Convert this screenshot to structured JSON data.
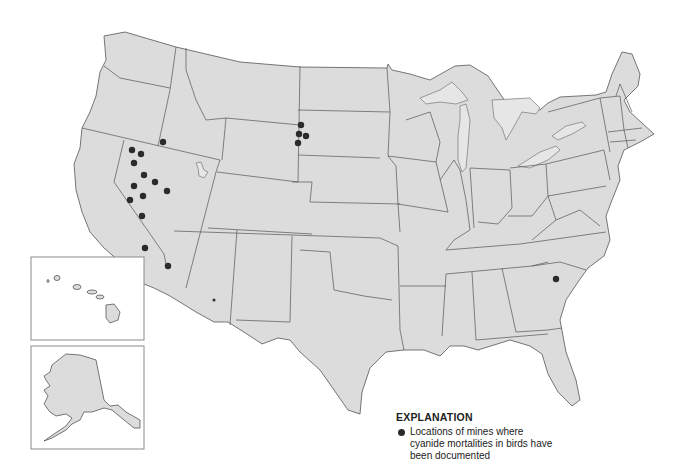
{
  "map": {
    "title": "",
    "region": "Conterminous United States with Alaska and Hawaii insets",
    "colors": {
      "land": "#dcdcdc",
      "border": "#555555",
      "dot": "#2b2b2b",
      "background": "#ffffff"
    },
    "insets": [
      {
        "name": "Hawaii",
        "box": [
          31,
          257,
          113,
          83
        ]
      },
      {
        "name": "Alaska",
        "box": [
          31,
          346,
          113,
          103
        ]
      }
    ],
    "mine_sites": [
      {
        "state": "Idaho",
        "x": 163,
        "y": 142,
        "r": 3.2
      },
      {
        "state": "Nevada",
        "x": 132,
        "y": 150,
        "r": 3.2
      },
      {
        "state": "Nevada",
        "x": 141,
        "y": 154,
        "r": 3.2
      },
      {
        "state": "Nevada",
        "x": 134,
        "y": 163,
        "r": 3.2
      },
      {
        "state": "Nevada",
        "x": 144,
        "y": 175,
        "r": 3.2
      },
      {
        "state": "Nevada",
        "x": 155,
        "y": 182,
        "r": 3.2
      },
      {
        "state": "Nevada",
        "x": 134,
        "y": 186,
        "r": 3.2
      },
      {
        "state": "Nevada",
        "x": 167,
        "y": 191,
        "r": 3.2
      },
      {
        "state": "Nevada",
        "x": 143,
        "y": 196,
        "r": 3.2
      },
      {
        "state": "Nevada",
        "x": 130,
        "y": 200,
        "r": 3.2
      },
      {
        "state": "Nevada",
        "x": 142,
        "y": 216,
        "r": 3.2
      },
      {
        "state": "California",
        "x": 145,
        "y": 248,
        "r": 3.2
      },
      {
        "state": "Arizona",
        "x": 168,
        "y": 266,
        "r": 3.2
      },
      {
        "state": "Arizona",
        "x": 214,
        "y": 300,
        "r": 1.5
      },
      {
        "state": "South Dakota",
        "x": 301,
        "y": 125,
        "r": 3.2
      },
      {
        "state": "South Dakota",
        "x": 299,
        "y": 134,
        "r": 3.2
      },
      {
        "state": "South Dakota",
        "x": 306,
        "y": 136,
        "r": 3.2
      },
      {
        "state": "South Dakota",
        "x": 298,
        "y": 143,
        "r": 3.2
      },
      {
        "state": "South Carolina",
        "x": 556,
        "y": 279,
        "r": 3.2
      }
    ]
  },
  "legend": {
    "title": "EXPLANATION",
    "entries": [
      {
        "symbol": "filled-circle",
        "label_lines": [
          "Locations of mines where",
          "cyanide mortalities in birds have",
          "been documented"
        ]
      }
    ]
  }
}
